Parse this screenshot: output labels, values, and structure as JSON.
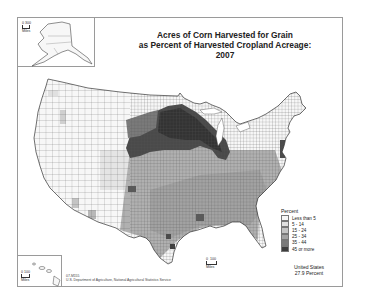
{
  "map": {
    "title_line1": "Acres of Corn Harvested for Grain",
    "title_line2": "as Percent of Harvested Cropland Acreage:  2007",
    "legend": {
      "title": "Percent",
      "classes": [
        {
          "label": "Less than 5",
          "color": "#f7f7f7"
        },
        {
          "label": "5 - 14",
          "color": "#e0e0e0"
        },
        {
          "label": "15 - 24",
          "color": "#c4c4c4"
        },
        {
          "label": "25 - 34",
          "color": "#a2a2a2"
        },
        {
          "label": "35 - 44",
          "color": "#7a7a7a"
        },
        {
          "label": "45 or more",
          "color": "#3d3d3d"
        }
      ]
    },
    "us_total_line1": "United States",
    "us_total_line2": "27.9 Percent",
    "source_code": "07-M155",
    "source": "U.S. Department of Agriculture, National Agricultural Statistics Service",
    "alaska_scale": {
      "min": "0",
      "max": "300",
      "unit": "Miles"
    },
    "hawaii_scale": {
      "min": "0",
      "max": "100",
      "unit": "Miles"
    },
    "conus_scale": {
      "min": "0",
      "max": "100",
      "unit": "Miles"
    }
  },
  "colors": {
    "border": "#9a9a9a",
    "county_line": "#555555",
    "background": "#ffffff"
  }
}
